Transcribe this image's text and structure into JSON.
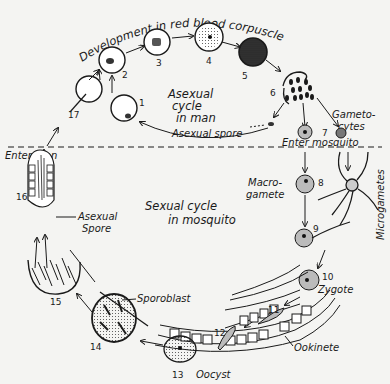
{
  "diagram": {
    "title": "Development in red blood corpuscles",
    "regions": {
      "asexual": [
        "Asexual",
        "cycle",
        "in man"
      ],
      "sexual": [
        "Sexual cycle",
        "in mosquito"
      ]
    },
    "labels": {
      "asexual_spore_top": "Asexual spore",
      "asexual_spore_left_1": "Asexual",
      "asexual_spore_left_2": "Spore",
      "gametocytes_1": "Gameto-",
      "gametocytes_2": "cytes",
      "enter_mosquito": "Enter mosquito",
      "enter_man": "Enter man",
      "macrogamete_1": "Macro-",
      "macrogamete_2": "gamete",
      "microgametes": "Microgametes",
      "zygote": "Zygote",
      "ookinete": "Ookinete",
      "oocyst": "Oocyst",
      "sporoblast": "Sporoblast"
    },
    "stages": [
      "1",
      "2",
      "3",
      "4",
      "5",
      "6",
      "7",
      "8",
      "9",
      "10",
      "11",
      "12",
      "13",
      "14",
      "15",
      "16",
      "17"
    ],
    "colors": {
      "ink": "#1a1a1a",
      "paper": "#f4f4f2"
    }
  }
}
